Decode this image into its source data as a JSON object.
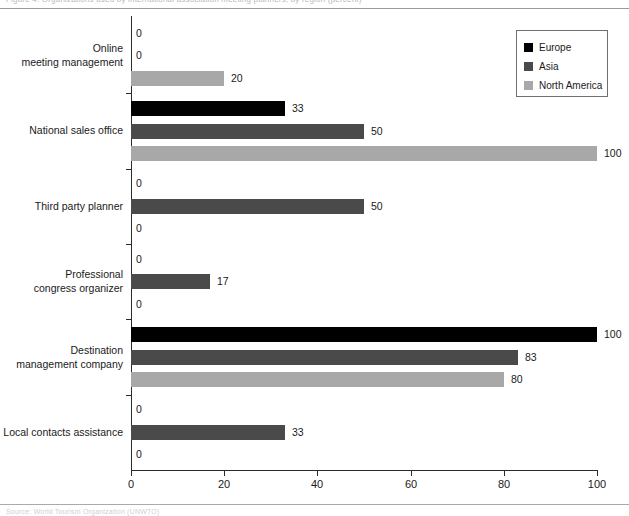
{
  "scan": {
    "top_text": "Figure 4.  Organizations used by international association meeting planners, by region (percent)",
    "bottom_text": "Source:  World Tourism Organization (UNWTO)"
  },
  "legend": {
    "position": "top-right",
    "items": [
      {
        "label": "Europe",
        "color": "#000000",
        "swatch": "legend-swatch-europe"
      },
      {
        "label": "Asia",
        "color": "#4a4a4a",
        "swatch": "legend-swatch-asia"
      },
      {
        "label": "North America",
        "color": "#a8a8a8",
        "swatch": "legend-swatch-north-america"
      }
    ]
  },
  "axis": {
    "x_ticks": [
      "0",
      "20",
      "40",
      "60",
      "80",
      "100"
    ],
    "x_tick_values": [
      0,
      20,
      40,
      60,
      80,
      100
    ],
    "xlim": [
      0,
      100
    ]
  },
  "chart_data": {
    "type": "bar",
    "orientation": "horizontal",
    "grouped": true,
    "title": "",
    "subtitle": "",
    "xlabel": "",
    "ylabel": "",
    "xlim": [
      0,
      100
    ],
    "grid": false,
    "legend_position": "top-right",
    "categories": [
      "Online meeting management",
      "National sales office",
      "Third party planner",
      "Professional congress organizer",
      "Destination management company",
      "Local contacts assistance"
    ],
    "series": [
      {
        "name": "Europe",
        "color": "#000000",
        "values": [
          0,
          33,
          0,
          0,
          100,
          0
        ]
      },
      {
        "name": "Asia",
        "color": "#4a4a4a",
        "values": [
          0,
          50,
          50,
          17,
          83,
          33
        ]
      },
      {
        "name": "North America",
        "color": "#a8a8a8",
        "values": [
          20,
          100,
          0,
          0,
          80,
          0
        ]
      }
    ],
    "data_labels": [
      {
        "category": "Online meeting management",
        "series": "Europe",
        "value": 0,
        "text": "0"
      },
      {
        "category": "Online meeting management",
        "series": "Asia",
        "value": 0,
        "text": "0"
      },
      {
        "category": "Online meeting management",
        "series": "North America",
        "value": 20,
        "text": "20"
      },
      {
        "category": "National sales office",
        "series": "Europe",
        "value": 33,
        "text": "33"
      },
      {
        "category": "National sales office",
        "series": "Asia",
        "value": 50,
        "text": "50"
      },
      {
        "category": "National sales office",
        "series": "North America",
        "value": 100,
        "text": "100"
      },
      {
        "category": "Third party planner",
        "series": "Europe",
        "value": 0,
        "text": "0"
      },
      {
        "category": "Third party planner",
        "series": "Asia",
        "value": 50,
        "text": "50"
      },
      {
        "category": "Third party planner",
        "series": "North America",
        "value": 0,
        "text": "0"
      },
      {
        "category": "Professional congress organizer",
        "series": "Europe",
        "value": 0,
        "text": "0"
      },
      {
        "category": "Professional congress organizer",
        "series": "Asia",
        "value": 17,
        "text": "17"
      },
      {
        "category": "Professional congress organizer",
        "series": "North America",
        "value": 0,
        "text": "0"
      },
      {
        "category": "Destination management company",
        "series": "Europe",
        "value": 100,
        "text": "100"
      },
      {
        "category": "Destination management company",
        "series": "Asia",
        "value": 83,
        "text": "83"
      },
      {
        "category": "Destination management company",
        "series": "North America",
        "value": 80,
        "text": "80"
      },
      {
        "category": "Local contacts assistance",
        "series": "Europe",
        "value": 0,
        "text": "0"
      },
      {
        "category": "Local contacts assistance",
        "series": "Asia",
        "value": 33,
        "text": "33"
      },
      {
        "category": "Local contacts assistance",
        "series": "North America",
        "value": 0,
        "text": "0"
      }
    ]
  },
  "category_label_lines": [
    [
      "Online",
      "meeting management"
    ],
    [
      "National sales office"
    ],
    [
      "Third party planner"
    ],
    [
      "Professional",
      "congress organizer"
    ],
    [
      "Destination",
      "management company"
    ],
    [
      "Local contacts assistance"
    ]
  ]
}
